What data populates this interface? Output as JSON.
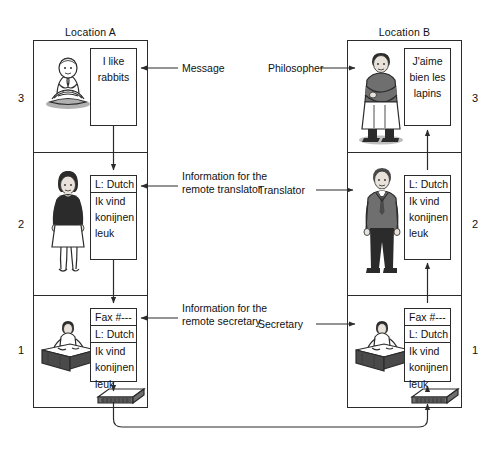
{
  "diagram": {
    "title_left": "Location A",
    "title_right": "Location B",
    "layer_numbers_left": [
      "3",
      "2",
      "1"
    ],
    "layer_numbers_right": [
      "3",
      "2",
      "1"
    ]
  },
  "left": {
    "layer3": {
      "actor_icon": "seated-philosopher-icon",
      "message_lines": [
        "I like",
        "rabbits"
      ]
    },
    "layer2": {
      "actor_icon": "standing-woman-translator-icon",
      "pdu_header": "L: Dutch",
      "pdu_lines": [
        "Ik vind",
        "konijnen",
        "leuk"
      ]
    },
    "layer1": {
      "actor_icon": "secretary-at-desk-icon",
      "fax_header": "Fax #---",
      "pdu_header": "L: Dutch",
      "pdu_lines": [
        "Ik vind",
        "konijnen",
        "leuk"
      ],
      "device_icon": "fax-machine-icon"
    }
  },
  "right": {
    "layer3": {
      "actor_icon": "standing-monk-philosopher-icon",
      "message_lines": [
        "J'aime",
        "bien les",
        "lapins"
      ]
    },
    "layer2": {
      "actor_icon": "standing-man-translator-icon",
      "pdu_header": "L: Dutch",
      "pdu_lines": [
        "Ik vind",
        "konijnen",
        "leuk"
      ]
    },
    "layer1": {
      "actor_icon": "secretary-at-desk-icon",
      "fax_header": "Fax #---",
      "pdu_header": "L: Dutch",
      "pdu_lines": [
        "Ik vind",
        "konijnen",
        "leuk"
      ],
      "device_icon": "fax-machine-icon"
    }
  },
  "annotations": {
    "message": "Message",
    "info_translator": "Information for the remote translator",
    "info_secretary": "Information for the remote secretary",
    "philosopher": "Philosopher",
    "translator": "Translator",
    "secretary": "Secretary"
  },
  "colors": {
    "ink": "#2b2b2b",
    "page": "#ffffff"
  }
}
